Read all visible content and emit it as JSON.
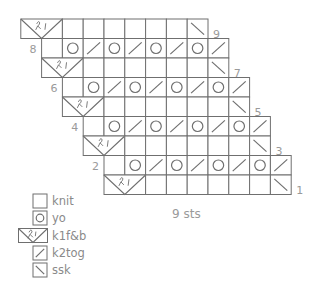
{
  "chart_data": {
    "type": "knitting-chart",
    "title": "",
    "width_label": "9 sts",
    "cell_w": 20.8,
    "cell_h": 19.5,
    "line_color": "#6f6f6f",
    "rows": [
      {
        "row": 9,
        "label": "9",
        "label_side": "right",
        "start_col": 0,
        "cells": [
          "kfb",
          "knit",
          "knit",
          "knit",
          "knit",
          "knit",
          "knit",
          "ssk"
        ]
      },
      {
        "row": 8,
        "label": "8",
        "label_side": "left",
        "start_col": 1,
        "cells": [
          "knit",
          "yo",
          "k2tog",
          "yo",
          "k2tog",
          "yo",
          "k2tog",
          "yo",
          "k2tog"
        ]
      },
      {
        "row": 7,
        "label": "7",
        "label_side": "right",
        "start_col": 1,
        "cells": [
          "kfb",
          "knit",
          "knit",
          "knit",
          "knit",
          "knit",
          "knit",
          "ssk"
        ]
      },
      {
        "row": 6,
        "label": "6",
        "label_side": "left",
        "start_col": 2,
        "cells": [
          "knit",
          "yo",
          "k2tog",
          "yo",
          "k2tog",
          "yo",
          "k2tog",
          "yo",
          "k2tog"
        ]
      },
      {
        "row": 5,
        "label": "5",
        "label_side": "right",
        "start_col": 2,
        "cells": [
          "kfb",
          "knit",
          "knit",
          "knit",
          "knit",
          "knit",
          "knit",
          "ssk"
        ]
      },
      {
        "row": 4,
        "label": "4",
        "label_side": "left",
        "start_col": 3,
        "cells": [
          "knit",
          "yo",
          "k2tog",
          "yo",
          "k2tog",
          "yo",
          "k2tog",
          "yo",
          "k2tog"
        ]
      },
      {
        "row": 3,
        "label": "3",
        "label_side": "right",
        "start_col": 3,
        "cells": [
          "kfb",
          "knit",
          "knit",
          "knit",
          "knit",
          "knit",
          "knit",
          "ssk"
        ]
      },
      {
        "row": 2,
        "label": "2",
        "label_side": "left",
        "start_col": 4,
        "cells": [
          "knit",
          "yo",
          "k2tog",
          "yo",
          "k2tog",
          "yo",
          "k2tog",
          "yo",
          "k2tog"
        ]
      },
      {
        "row": 1,
        "label": "1",
        "label_side": "right",
        "start_col": 4,
        "cells": [
          "kfb",
          "knit",
          "knit",
          "knit",
          "knit",
          "knit",
          "knit",
          "ssk"
        ]
      }
    ],
    "legend": [
      {
        "symbol": "knit",
        "label": "knit"
      },
      {
        "symbol": "yo",
        "label": "yo"
      },
      {
        "symbol": "kfb",
        "label": "k1f&b"
      },
      {
        "symbol": "k2tog",
        "label": "k2tog"
      },
      {
        "symbol": "ssk",
        "label": "ssk"
      }
    ]
  }
}
